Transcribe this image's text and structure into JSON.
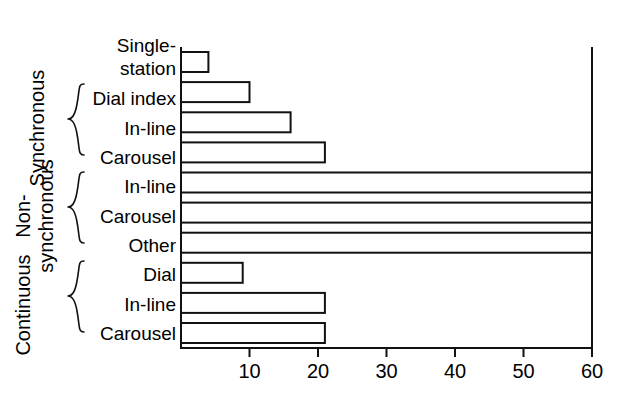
{
  "chart_data": {
    "type": "bar",
    "orientation": "horizontal",
    "title": "",
    "xlabel": "",
    "ylabel": "",
    "xlim": [
      0,
      60
    ],
    "xticks": [
      10,
      20,
      30,
      40,
      50,
      60
    ],
    "xtick_labels": [
      "10",
      "20",
      "30",
      "40",
      "50",
      "60"
    ],
    "grid": false,
    "legend": "none",
    "categories": [
      "Single-station",
      "Dial index",
      "In-line",
      "Carousel",
      "In-line",
      "Carousel",
      "Other",
      "Dial",
      "In-line",
      "Carousel"
    ],
    "values": [
      4,
      10,
      16,
      21,
      60,
      60,
      60,
      9,
      21,
      21
    ],
    "value_notes": [
      "",
      "",
      "",
      "",
      "at or beyond axis maximum",
      "at or beyond axis maximum",
      "at or beyond axis maximum",
      "",
      "",
      ""
    ],
    "groups": [
      {
        "label": "Synchronous",
        "label_lines": [
          "Synchronous"
        ],
        "category_indices": [
          0,
          1,
          2,
          3
        ],
        "brace_indices": [
          1,
          2,
          3
        ]
      },
      {
        "label": "Non-synchronous",
        "label_lines": [
          "Non-",
          "synchronous"
        ],
        "category_indices": [
          4,
          5,
          6
        ],
        "brace_indices": [
          4,
          5,
          6
        ]
      },
      {
        "label": "Continuous",
        "label_lines": [
          "Continuous"
        ],
        "category_indices": [
          7,
          8,
          9
        ],
        "brace_indices": [
          7,
          8,
          9
        ]
      }
    ],
    "colors": {
      "bar_fill": "#ffffff",
      "bar_stroke": "#111111",
      "axis": "#111111",
      "text": "#000000",
      "background": "#ffffff"
    }
  },
  "category_labels": {
    "0": {
      "lines": [
        "Single-",
        "station"
      ]
    },
    "1": {
      "lines": [
        "Dial index"
      ]
    },
    "2": {
      "lines": [
        "In-line"
      ]
    },
    "3": {
      "lines": [
        "Carousel"
      ]
    },
    "4": {
      "lines": [
        "In-line"
      ]
    },
    "5": {
      "lines": [
        "Carousel"
      ]
    },
    "6": {
      "lines": [
        "Other"
      ]
    },
    "7": {
      "lines": [
        "Dial"
      ]
    },
    "8": {
      "lines": [
        "In-line"
      ]
    },
    "9": {
      "lines": [
        "Carousel"
      ]
    }
  },
  "group_labels": {
    "synchronous": "Synchronous",
    "non_synchronous_line1": "Non-",
    "non_synchronous_line2": "synchronous",
    "continuous": "Continuous"
  },
  "tick_labels": {
    "t10": "10",
    "t20": "20",
    "t30": "30",
    "t40": "40",
    "t50": "50",
    "t60": "60"
  }
}
